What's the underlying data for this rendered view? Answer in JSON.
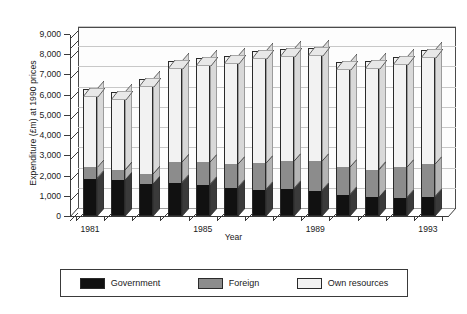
{
  "chart_data": {
    "type": "bar",
    "stacked": true,
    "title": "",
    "xlabel": "Year",
    "ylabel": "Expenditure (£m) at 1990 prices",
    "ylim": [
      0,
      9000
    ],
    "ytick_step": 1000,
    "ytick_labels": [
      "0",
      "1,000",
      "2,000",
      "3,000",
      "4,000",
      "5,000",
      "6,000",
      "7,000",
      "8,000",
      "9,000"
    ],
    "grid": true,
    "legend_position": "bottom",
    "categories": [
      "1981",
      "1982",
      "1983",
      "1984",
      "1985",
      "1986",
      "1987",
      "1988",
      "1989",
      "1990",
      "1991",
      "1992",
      "1993"
    ],
    "xtick_labels_shown": [
      "1981",
      "1985",
      "1989",
      "1993"
    ],
    "series": [
      {
        "name": "Government",
        "color": "#111111",
        "values": [
          1850,
          1800,
          1600,
          1650,
          1550,
          1400,
          1300,
          1350,
          1250,
          1050,
          950,
          900,
          950
        ]
      },
      {
        "name": "Foreign",
        "color": "#8c8c8c",
        "values": [
          550,
          500,
          500,
          1000,
          1100,
          1150,
          1300,
          1350,
          1450,
          1350,
          1350,
          1500,
          1600
        ]
      },
      {
        "name": "Own resources",
        "color": "#f2f2f2",
        "values": [
          3900,
          3850,
          4700,
          5000,
          5150,
          5350,
          5550,
          5550,
          5600,
          5200,
          5350,
          5450,
          5650
        ]
      }
    ],
    "totals": [
      6300,
      6150,
      6800,
      7650,
      7800,
      7900,
      8150,
      8250,
      8300,
      7600,
      7650,
      7850,
      8200
    ]
  },
  "legend": {
    "items": [
      {
        "label": "Government",
        "swatch": "gov"
      },
      {
        "label": "Foreign",
        "swatch": "for"
      },
      {
        "label": "Own resources",
        "swatch": "own"
      }
    ]
  }
}
